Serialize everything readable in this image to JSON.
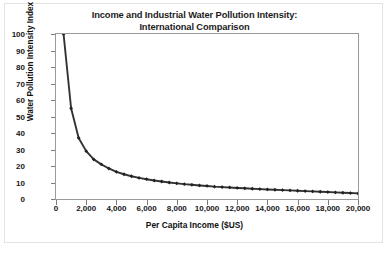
{
  "chart_data": {
    "type": "line",
    "title": "Income and Industrial Water Pollution Intensity:",
    "subtitle": "International Comparison",
    "xlabel": "Per Capita Income ($US)",
    "ylabel": "Water Pollution Intensity Index",
    "xlim": [
      0,
      20000
    ],
    "ylim": [
      0,
      100
    ],
    "xticks": [
      "0",
      "2,000",
      "4,000",
      "6,000",
      "8,000",
      "10,000",
      "12,000",
      "14,000",
      "16,000",
      "18,000",
      "20,000"
    ],
    "xtick_values": [
      0,
      2000,
      4000,
      6000,
      8000,
      10000,
      12000,
      14000,
      16000,
      18000,
      20000
    ],
    "yticks": [
      "0",
      "10",
      "20",
      "30",
      "40",
      "50",
      "60",
      "70",
      "80",
      "90",
      "100"
    ],
    "ytick_values": [
      0,
      10,
      20,
      30,
      40,
      50,
      60,
      70,
      80,
      90,
      100
    ],
    "grid": false,
    "legend": "none",
    "marker": "diamond",
    "line_color": "#333333",
    "marker_color": "#222222",
    "frame_color": "#9a9a9a",
    "series": [
      {
        "name": "Water Pollution Intensity Index",
        "x": [
          500,
          1000,
          1500,
          2000,
          2500,
          3000,
          3500,
          4000,
          4500,
          5000,
          5500,
          6000,
          6500,
          7000,
          7500,
          8000,
          8500,
          9000,
          9500,
          10000,
          10500,
          11000,
          11500,
          12000,
          12500,
          13000,
          13500,
          14000,
          14500,
          15000,
          15500,
          16000,
          16500,
          17000,
          17500,
          18000,
          18500,
          19000,
          19500,
          20000
        ],
        "values": [
          100,
          55,
          37,
          29,
          24,
          21,
          18.5,
          16.5,
          15,
          13.8,
          12.8,
          12,
          11.2,
          10.6,
          10,
          9.5,
          9,
          8.6,
          8.2,
          7.9,
          7.5,
          7.2,
          7,
          6.7,
          6.5,
          6.2,
          6,
          5.8,
          5.6,
          5.4,
          5.2,
          5,
          4.8,
          4.6,
          4.4,
          4.2,
          4,
          3.8,
          3.6,
          3.4
        ]
      }
    ]
  }
}
